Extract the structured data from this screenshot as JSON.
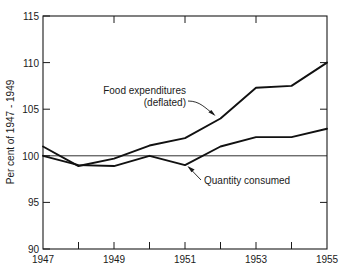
{
  "chart_data": {
    "type": "line",
    "title": "",
    "subtitle": "",
    "xlabel": "",
    "ylabel": "Per cent of 1947 - 1949",
    "xlim": [
      1947,
      1955
    ],
    "ylim": [
      90,
      115
    ],
    "yticks": [
      90,
      95,
      100,
      105,
      110,
      115
    ],
    "ytick_labels": [
      "90",
      "95",
      "100",
      "105",
      "110",
      "115"
    ],
    "xticks": [
      1947,
      1948,
      1949,
      1950,
      1951,
      1952,
      1953,
      1954,
      1955
    ],
    "xtick_labels": [
      "1947",
      "",
      "1949",
      "",
      "1951",
      "",
      "1953",
      "",
      "1955"
    ],
    "grid": false,
    "legend": "none",
    "reference_line": {
      "value": 100,
      "label": "100"
    },
    "x": [
      1947,
      1948,
      1949,
      1950,
      1951,
      1952,
      1953,
      1954,
      1955
    ],
    "series": [
      {
        "name": "Food expenditures (deflated)",
        "values": [
          101.0,
          98.9,
          99.7,
          101.1,
          101.9,
          104.0,
          107.3,
          107.5,
          110.0
        ]
      },
      {
        "name": "Quantity consumed",
        "values": [
          100.0,
          99.0,
          98.9,
          100.0,
          99.0,
          101.0,
          102.0,
          102.0,
          102.9
        ]
      }
    ],
    "annotations": [
      {
        "name": "food-expenditures-annotation",
        "line1": "Food expenditures",
        "line2": "(deflated)",
        "target_x": 1952,
        "target_y": 104.0
      },
      {
        "name": "quantity-consumed-annotation",
        "line1": "Quantity consumed",
        "line2": "",
        "target_x": 1951,
        "target_y": 99.0
      }
    ]
  },
  "axes": {
    "y_title": "Per cent of 1947 - 1949",
    "y_labels": {
      "t115": "115",
      "t110": "110",
      "t105": "105",
      "t100": "100",
      "t95": "95",
      "t90": "90"
    },
    "x_labels": {
      "x1947": "1947",
      "x1949": "1949",
      "x1951": "1951",
      "x1953": "1953",
      "x1955": "1955"
    }
  },
  "annotations": {
    "food_line1": "Food expenditures",
    "food_line2": "(deflated)",
    "quantity_label": "Quantity consumed"
  },
  "colors": {
    "ink": "#1a1a1a",
    "series": "#111111",
    "background": "#ffffff"
  }
}
